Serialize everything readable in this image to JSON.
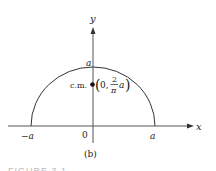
{
  "figure": {
    "subfigure_label": "(b)",
    "caption_fragment": "FIGURE 3.1"
  },
  "axes": {
    "x_label": "x",
    "y_label": "y",
    "origin_label": "0",
    "x_neg_tick": "−a",
    "x_pos_tick": "a",
    "y_top_tick": "a"
  },
  "shape": {
    "type": "semicircle",
    "radius_label": "a"
  },
  "center_of_mass": {
    "label": "c.m.",
    "coord_open": "(0,",
    "frac_num": "2",
    "frac_den": "π",
    "frac_suffix": "a",
    "coord_close": ")"
  },
  "colors": {
    "line": "#333333",
    "axis": "#555555",
    "text": "#222222"
  }
}
